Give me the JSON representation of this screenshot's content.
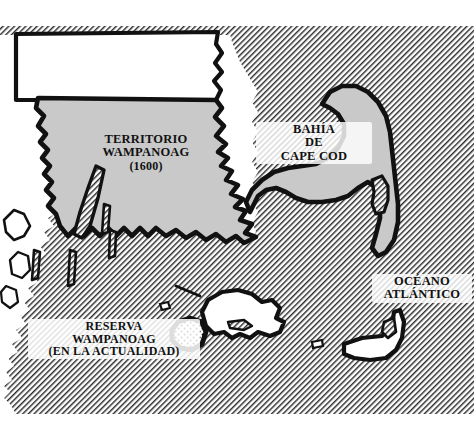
{
  "figure": {
    "kind": "historical-thematic-map",
    "width": 474,
    "height": 423,
    "region_depicted": "Massachusetts coast, Cape Cod and islands"
  },
  "labels": {
    "territory": {
      "name": "territory-label",
      "line1": "TERRITORIO",
      "line2": "WAMPANOAG",
      "line3": "(1600)"
    },
    "bay": {
      "name": "bay-label",
      "line1": "BAHÍA",
      "line2": "DE",
      "line3": "CAPE COD"
    },
    "ocean": {
      "name": "ocean-label",
      "line1": "OCÉANO",
      "line2": "ATLÁNTICO"
    },
    "reserve": {
      "name": "reserve-label",
      "line1": "RESERVA",
      "line2": "WAMPANOAG",
      "line3": "(EN LA ACTUALIDAD)"
    }
  },
  "map_features": {
    "territory_fill_label": "Territorio Wampanoag (1600) - shaded area",
    "reserve_fill_label": "Reserva Wampanoag actual - stippled area",
    "water_label": "Water - diagonal hatching",
    "land_outside_territory_label": "Land outside territory - white fill",
    "islands": [
      "Martha's Vineyard",
      "Nantucket",
      "Elizabeth Islands"
    ]
  },
  "colors": {
    "ink": "#111111",
    "territory_gray": "#c9c9c9",
    "water_hatch_line": "#2b2b2b",
    "water_background": "#ffffff",
    "land_white": "#ffffff",
    "reserve_outline": "#111111",
    "reserve_stipple": "#111111"
  },
  "style": {
    "hatch_angle_degrees": 45,
    "hatch_spacing_px": 4,
    "coastline_stroke_px": 4.5
  }
}
